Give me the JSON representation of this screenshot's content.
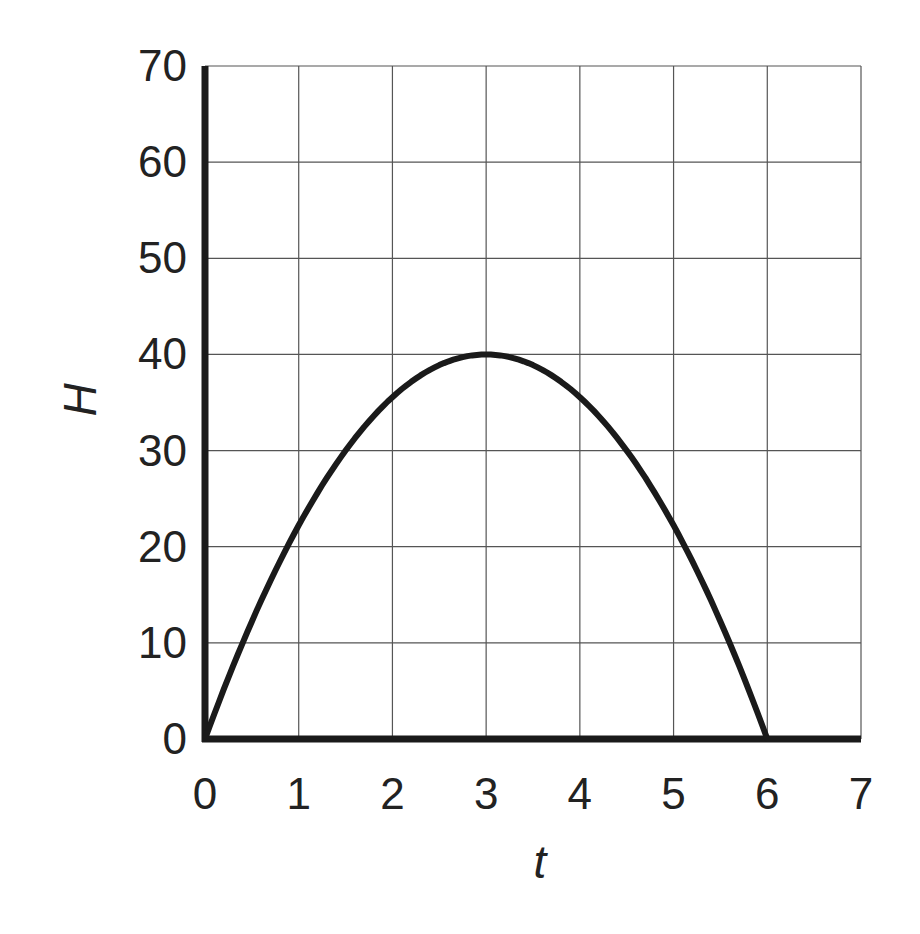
{
  "chart_data": {
    "type": "line",
    "title": "",
    "xlabel": "t",
    "ylabel": "H",
    "xlim": [
      0,
      7
    ],
    "ylim": [
      0,
      70
    ],
    "grid": true,
    "x_ticks": [
      "0",
      "1",
      "2",
      "3",
      "4",
      "5",
      "6",
      "7"
    ],
    "y_ticks": [
      "0",
      "10",
      "20",
      "30",
      "40",
      "50",
      "60",
      "70"
    ],
    "series": [
      {
        "name": "H(t)",
        "equation": "H = 40 - (40/9)(t-3)^2 for 0<=t<=6, H = 0 for t>6",
        "x": [
          0,
          0.5,
          1,
          1.5,
          2,
          2.5,
          3,
          3.5,
          4,
          4.5,
          5,
          5.5,
          6,
          7
        ],
        "values": [
          0,
          12.2,
          22.2,
          30,
          35.6,
          38.9,
          40,
          38.9,
          35.6,
          30,
          22.2,
          12.2,
          0,
          0
        ]
      }
    ],
    "colors": {
      "curve": "#1a1a1a",
      "grid": "#555555",
      "axes": "#1a1a1a"
    }
  }
}
